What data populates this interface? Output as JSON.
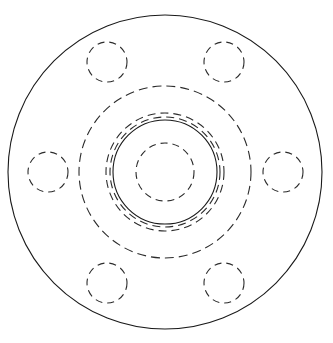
{
  "document": {
    "title": "Flange Front View",
    "drawing_type": "engineering-orthographic-view",
    "background_color": "#ffffff",
    "line_color": "#1a1a1a",
    "hidden_line_color": "#2b2b2b"
  },
  "canvas": {
    "width": 333,
    "height": 343,
    "center_x": 165,
    "center_y": 172
  },
  "geometry": {
    "outer_flange": {
      "name": "outer-flange-edge",
      "radius": 157,
      "style": "solid",
      "cx": 165,
      "cy": 172
    },
    "bolt_circle_guide": {
      "name": "bolt-circle-guideline",
      "radius": 86,
      "style": "dashed",
      "dash": "9 5",
      "cx": 165,
      "cy": 172
    },
    "hub_outer_ring": {
      "name": "hub-outer-ring",
      "radius": 59,
      "style": "dashed",
      "dash": "8 5",
      "cx": 165,
      "cy": 172
    },
    "hub_inner_ring": {
      "name": "hub-inner-ring",
      "radius": 52,
      "style": "solid",
      "cx": 165,
      "cy": 172
    },
    "hub_mid_ring": {
      "name": "hub-mid-ring",
      "radius": 55,
      "style": "dashed",
      "dash": "8 5",
      "cx": 165,
      "cy": 172
    },
    "center_bore": {
      "name": "center-bore",
      "radius": 29,
      "style": "dashed",
      "dash": "7 5",
      "cx": 165,
      "cy": 172
    },
    "bolt_holes": {
      "name": "bolt-hole-set",
      "count": 6,
      "hole_radius": 20,
      "pitch_circle_radius": 117,
      "style": "dashed",
      "dash": "7 5",
      "positions": [
        {
          "label": "bolt-hole-top-left",
          "cx": 107,
          "cy": 62,
          "angle_deg": 240
        },
        {
          "label": "bolt-hole-top-right",
          "cx": 224,
          "cy": 62,
          "angle_deg": 300
        },
        {
          "label": "bolt-hole-right",
          "cx": 283,
          "cy": 172,
          "angle_deg": 0
        },
        {
          "label": "bolt-hole-bottom-right",
          "cx": 224,
          "cy": 283,
          "angle_deg": 60
        },
        {
          "label": "bolt-hole-bottom-left",
          "cx": 107,
          "cy": 283,
          "angle_deg": 120
        },
        {
          "label": "bolt-hole-left",
          "cx": 48,
          "cy": 172,
          "angle_deg": 180
        }
      ]
    }
  }
}
